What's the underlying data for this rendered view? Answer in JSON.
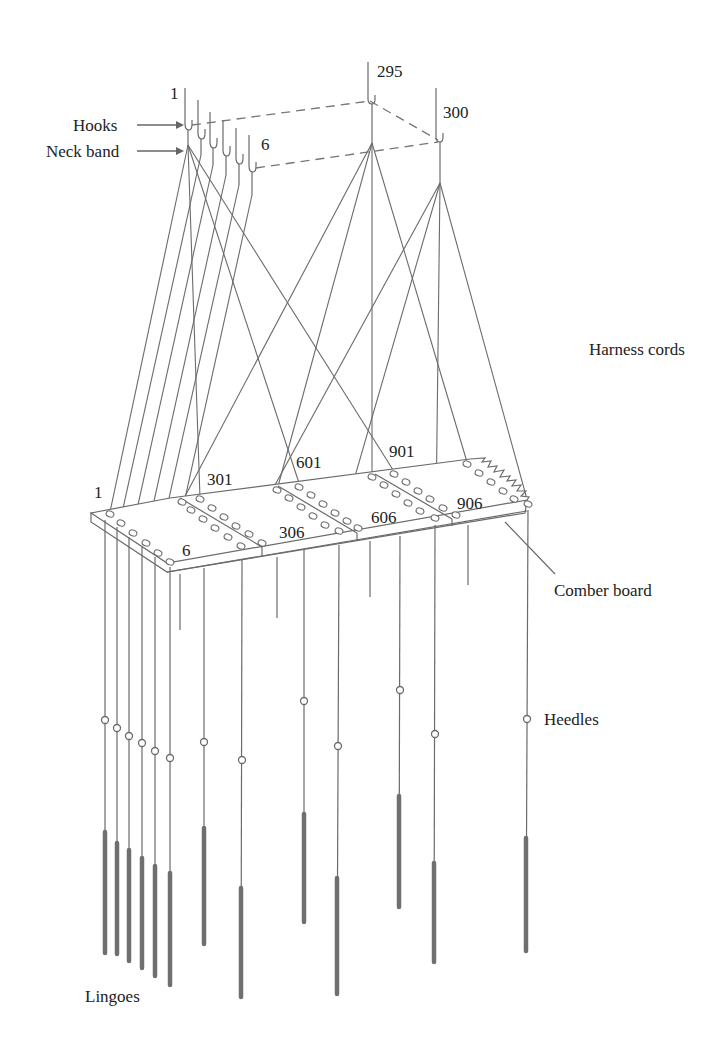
{
  "figure": {
    "labels": {
      "hooks": "Hooks",
      "neck_band": "Neck band",
      "harness_cords": "Harness cords",
      "comber_board": "Comber board",
      "heddles": "Heedles",
      "lingoes": "Lingoes"
    },
    "hook_numbers": {
      "first": "1",
      "sixth": "6",
      "h295": "295",
      "h300": "300"
    },
    "board_numbers": {
      "b1": "1",
      "b6": "6",
      "b301": "301",
      "b306": "306",
      "b601": "601",
      "b606": "606",
      "b901": "901",
      "b906": "906"
    },
    "colors": {
      "line": "#6b6b6b",
      "text": "#222222",
      "lingo": "#6f6f6f",
      "background": "#ffffff"
    }
  }
}
